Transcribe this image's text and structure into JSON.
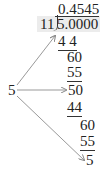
{
  "division": {
    "quotient": "0.4545",
    "divisor": "11",
    "dividend": "5.0000",
    "steps": [
      {
        "value": "4 4",
        "underlined": true
      },
      {
        "value": "60",
        "underlined": false
      },
      {
        "value": "55",
        "underlined": true
      },
      {
        "value": "50",
        "underlined": false
      },
      {
        "value": "44",
        "underlined": true
      },
      {
        "value": "60",
        "underlined": false
      },
      {
        "value": "55",
        "underlined": true
      },
      {
        "value": "5",
        "underlined": false
      }
    ]
  },
  "remainder_label": "5",
  "colors": {
    "shade": "#ececec",
    "arrow": "#888888",
    "text": "#222222"
  }
}
